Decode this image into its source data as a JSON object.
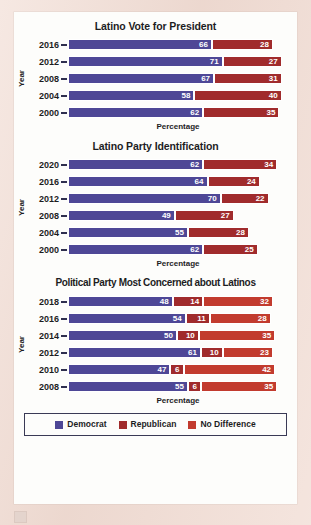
{
  "figure": {
    "series_colors": {
      "democrat": "#4e4796",
      "republican": "#a02b2c",
      "no_difference": "#c23b2e"
    },
    "legend": [
      {
        "key": "democrat",
        "label": "Democrat",
        "swatch": "legend-swatch-democrat"
      },
      {
        "key": "republican",
        "label": "Republican",
        "swatch": "legend-swatch-republican"
      },
      {
        "key": "no_difference",
        "label": "No Difference",
        "swatch": "legend-swatch-no-difference"
      }
    ]
  },
  "chart_data": [
    {
      "id": "latino-vote-for-president",
      "type": "bar",
      "orientation": "horizontal",
      "stacked": true,
      "title": "Latino Vote for President",
      "xlabel": "Percentage",
      "ylabel": "Year",
      "xlim": [
        0,
        100
      ],
      "grid": false,
      "legend_position": "bottom",
      "categories": [
        "2016",
        "2012",
        "2008",
        "2004",
        "2000"
      ],
      "series": [
        {
          "name": "Democrat",
          "values": [
            66,
            71,
            67,
            58,
            62
          ]
        },
        {
          "name": "Republican",
          "values": [
            28,
            27,
            31,
            40,
            35
          ]
        }
      ]
    },
    {
      "id": "latino-party-identification",
      "type": "bar",
      "orientation": "horizontal",
      "stacked": true,
      "title": "Latino Party Identification",
      "xlabel": "Percentage",
      "ylabel": "Year",
      "xlim": [
        0,
        100
      ],
      "grid": false,
      "legend_position": "bottom",
      "categories": [
        "2020",
        "2016",
        "2012",
        "2008",
        "2004",
        "2000"
      ],
      "series": [
        {
          "name": "Democrat",
          "values": [
            62,
            64,
            70,
            49,
            55,
            62
          ]
        },
        {
          "name": "Republican",
          "values": [
            34,
            24,
            22,
            27,
            28,
            25
          ]
        }
      ]
    },
    {
      "id": "political-party-most-concerned-about-latinos",
      "type": "bar",
      "orientation": "horizontal",
      "stacked": true,
      "title": "Political Party Most Concerned about Latinos",
      "xlabel": "Percentage",
      "ylabel": "Year",
      "xlim": [
        0,
        100
      ],
      "grid": false,
      "legend_position": "bottom",
      "categories": [
        "2018",
        "2016",
        "2014",
        "2012",
        "2010",
        "2008"
      ],
      "series": [
        {
          "name": "Democrat",
          "values": [
            48,
            54,
            50,
            61,
            47,
            55
          ]
        },
        {
          "name": "Republican",
          "values": [
            14,
            11,
            10,
            10,
            6,
            6
          ]
        },
        {
          "name": "No Difference",
          "values": [
            32,
            28,
            35,
            23,
            42,
            35
          ]
        }
      ]
    }
  ]
}
